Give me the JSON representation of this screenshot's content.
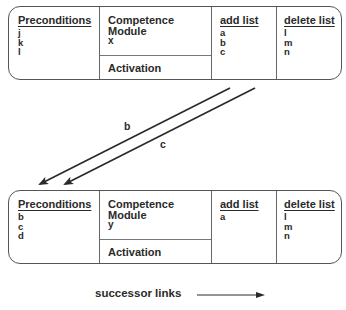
{
  "modules": [
    {
      "id": "x",
      "preconditions": {
        "header": "Preconditions",
        "items": [
          "j",
          "k",
          "l"
        ]
      },
      "competence": {
        "line1": "Competence",
        "line2": "Module",
        "name": "x",
        "activation": "Activation"
      },
      "add_list": {
        "header": "add list",
        "items": [
          "a",
          "b",
          "c"
        ]
      },
      "delete_list": {
        "header": "delete list",
        "items": [
          "l",
          "m",
          "n"
        ]
      }
    },
    {
      "id": "y",
      "preconditions": {
        "header": "Preconditions",
        "items": [
          "b",
          "c",
          "d"
        ]
      },
      "competence": {
        "line1": "Competence",
        "line2": "Module",
        "name": "y",
        "activation": "Activation"
      },
      "add_list": {
        "header": "add list",
        "items": [
          "a"
        ]
      },
      "delete_list": {
        "header": "delete list",
        "items": [
          "l",
          "m",
          "n"
        ]
      }
    }
  ],
  "links": [
    {
      "label": "b",
      "from": "module-x",
      "to": "module-y"
    },
    {
      "label": "c",
      "from": "module-x",
      "to": "module-y"
    }
  ],
  "legend": {
    "label": "successor links"
  },
  "colors": {
    "line": "#2a2a2a",
    "border": "#555555"
  }
}
